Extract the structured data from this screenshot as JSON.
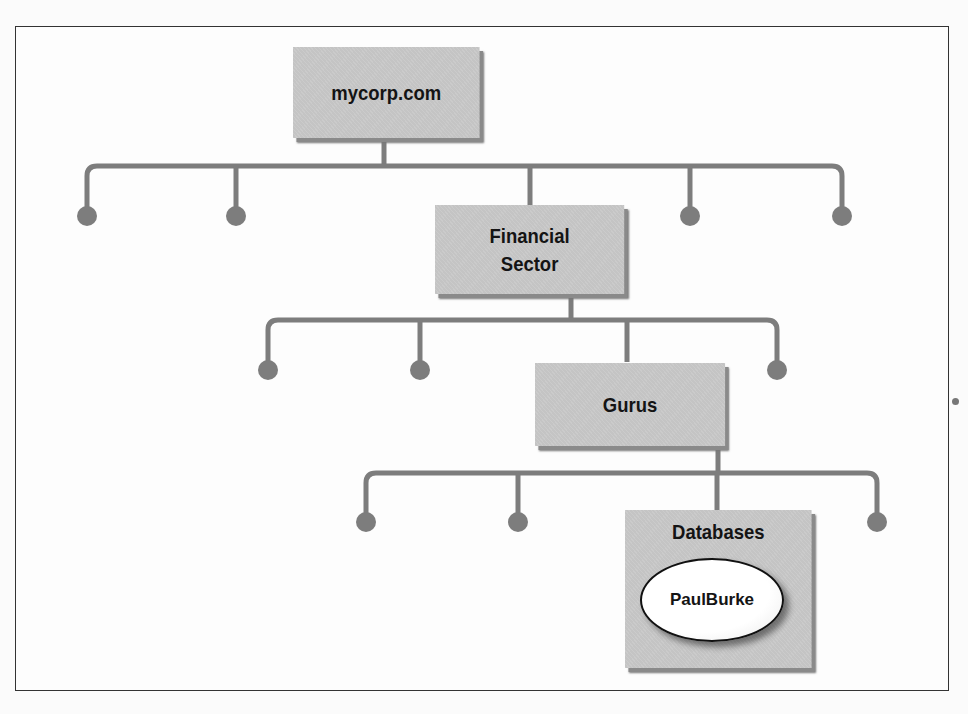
{
  "diagram": {
    "type": "hierarchy",
    "colors": {
      "node_fill": "#c4c4c4",
      "connector": "#7d7d7d",
      "leaf_dot": "#7d7d7d",
      "user_ellipse_fill": "#ffffff",
      "border": "#333333"
    },
    "nodes": [
      {
        "id": "root",
        "label": "mycorp.com",
        "level": 0
      },
      {
        "id": "financial",
        "label_lines": [
          "Financial",
          "Sector"
        ],
        "level": 1,
        "parent": "root"
      },
      {
        "id": "gurus",
        "label": "Gurus",
        "level": 2,
        "parent": "financial"
      },
      {
        "id": "databases",
        "label": "Databases",
        "level": 3,
        "parent": "gurus"
      }
    ],
    "user_object": {
      "label": "PaulBurke",
      "container": "databases"
    },
    "sibling_leaf_counts": {
      "level_1": 4,
      "level_2": 3,
      "level_3": 3
    }
  }
}
